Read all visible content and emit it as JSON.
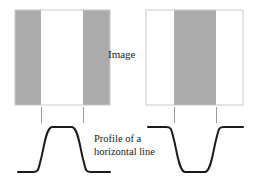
{
  "figure": {
    "title_text": "",
    "background_color": "#ffffff",
    "labels": {
      "image": "Image",
      "profile_line1": "Profile of a",
      "profile_line2": "horizontal line"
    },
    "colors": {
      "gray_band": "#ababab",
      "white_band": "#ffffff",
      "square_border": "#c8c8c8",
      "curve_stroke": "#1a1a1a",
      "tick_stroke": "#9a9a9a",
      "text": "#1a1a1a"
    },
    "panels": [
      {
        "id": "left-panel",
        "name": "bright-bar-on-gray",
        "square": {
          "x": 15,
          "y": 10,
          "width": 95,
          "height": 95
        },
        "bands": [
          {
            "name": "left-gray-band",
            "x": 15,
            "width": 26,
            "fill": "#ababab"
          },
          {
            "name": "center-white-band",
            "x": 41,
            "width": 42,
            "fill": "#ffffff"
          },
          {
            "name": "right-gray-band",
            "x": 83,
            "width": 27,
            "fill": "#ababab"
          }
        ],
        "ticks": [
          {
            "name": "tick-left-boundary",
            "x": 41,
            "y1": 107,
            "y2": 123
          },
          {
            "name": "tick-right-boundary",
            "x": 83,
            "y1": 107,
            "y2": 123
          }
        ],
        "profile": {
          "type": "step-up-plateau",
          "baseline_y": 172,
          "plateau_y": 127,
          "x_start": 18,
          "x_end": 110,
          "edge_left": 41,
          "edge_right": 83,
          "path": "M18,172 L33,172 C38,172 38,170 41,159 C44,148 46,128 52,127 L72,127 C78,128 80,148 83,159 C86,170 86,172 91,172 L110,172"
        }
      },
      {
        "id": "right-panel",
        "name": "dark-bar-on-white",
        "square": {
          "x": 146,
          "y": 10,
          "width": 97,
          "height": 95
        },
        "bands": [
          {
            "name": "left-white-band",
            "x": 146,
            "width": 28,
            "fill": "#ffffff"
          },
          {
            "name": "center-gray-band",
            "x": 174,
            "width": 42,
            "fill": "#ababab"
          },
          {
            "name": "right-white-band",
            "x": 216,
            "width": 27,
            "fill": "#ffffff"
          }
        ],
        "ticks": [
          {
            "name": "tick-left-boundary",
            "x": 174,
            "y1": 107,
            "y2": 123
          },
          {
            "name": "tick-right-boundary",
            "x": 216,
            "y1": 107,
            "y2": 123
          }
        ],
        "profile": {
          "type": "step-down-well",
          "baseline_y": 127,
          "trough_y": 172,
          "x_start": 148,
          "x_end": 243,
          "edge_left": 174,
          "edge_right": 216,
          "path": "M148,127 L166,127 C171,127 171,129 174,140 C177,151 179,171 185,172 L205,172 C211,171 213,151 216,140 C219,129 219,127 224,127 L243,127"
        }
      }
    ]
  }
}
